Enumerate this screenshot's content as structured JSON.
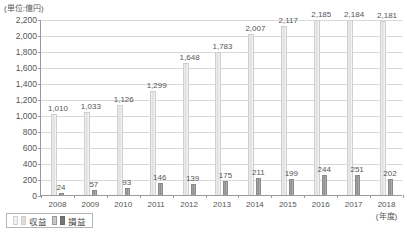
{
  "unit_note": "(単位:億円)",
  "axis_note": "(年度)",
  "legend": {
    "items": [
      {
        "label": "収益",
        "key": "revenue"
      },
      {
        "label": "損益",
        "key": "profit"
      }
    ]
  },
  "colors": {
    "revenue_bar": "#dedede",
    "profit_bar": "#8f8f8f",
    "gridline": "#d8d8d8",
    "axis": "#9a9a9a",
    "text": "#555555"
  },
  "chart_data": {
    "type": "bar",
    "title": "",
    "subtitle": "",
    "xlabel": "(年度)",
    "ylabel": "(単位:億円)",
    "ylim": [
      0,
      2200
    ],
    "ytick_step": 200,
    "yticks": [
      0,
      200,
      400,
      600,
      800,
      1000,
      1200,
      1400,
      1600,
      1800,
      2000,
      2200
    ],
    "ytick_labels": [
      "0",
      "200",
      "400",
      "600",
      "800",
      "1,000",
      "1,200",
      "1,400",
      "1,600",
      "1,800",
      "2,000",
      "2,200"
    ],
    "grid": true,
    "legend_position": "bottom-left",
    "categories": [
      "2008",
      "2009",
      "2010",
      "2011",
      "2012",
      "2013",
      "2014",
      "2015",
      "2016",
      "2017",
      "2018"
    ],
    "series": [
      {
        "name": "収益",
        "values": [
          1010,
          1033,
          1126,
          1299,
          1648,
          1783,
          2007,
          2117,
          2185,
          2184,
          2181
        ],
        "value_labels": [
          "1,010",
          "1,033",
          "1,126",
          "1,299",
          "1,648",
          "1,783",
          "2,007",
          "2,117",
          "2,185",
          "2,184",
          "2,181"
        ]
      },
      {
        "name": "損益",
        "values": [
          24,
          57,
          93,
          146,
          139,
          175,
          211,
          199,
          244,
          251,
          202
        ],
        "value_labels": [
          "24",
          "57",
          "93",
          "146",
          "139",
          "175",
          "211",
          "199",
          "244",
          "251",
          "202"
        ]
      }
    ]
  }
}
